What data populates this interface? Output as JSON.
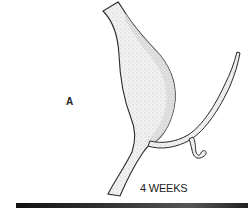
{
  "figure": {
    "panel_label": "A",
    "stage_label": "4 WEEKS",
    "colors": {
      "outline": "#2a2a2a",
      "stipple": "#9a9a9a",
      "fill": "#ececec",
      "bar": "#222222"
    }
  }
}
